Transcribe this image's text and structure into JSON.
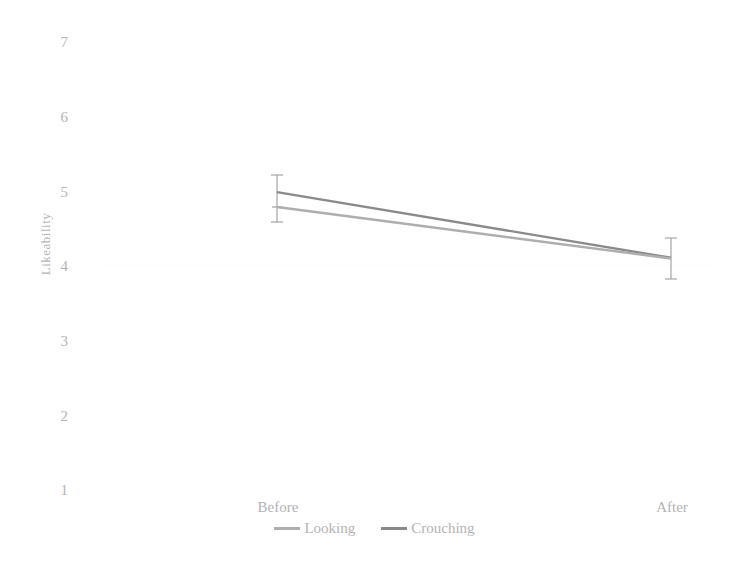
{
  "chart_data": {
    "type": "line",
    "title": "",
    "xlabel": "",
    "ylabel": "Likeability",
    "categories": [
      "Before",
      "After"
    ],
    "ylim": [
      1,
      7
    ],
    "yticks": [
      1,
      2,
      3,
      4,
      5,
      6,
      7
    ],
    "ytick_labels": [
      "1",
      "2",
      "3",
      "4",
      "5",
      "6",
      "7"
    ],
    "grid": false,
    "legend_position": "bottom-center",
    "series": [
      {
        "name": "Looking",
        "color": "#aeaeae",
        "values": [
          4.79,
          4.1
        ],
        "error_low": [
          4.62,
          3.86
        ],
        "error_high": [
          4.97,
          4.37
        ]
      },
      {
        "name": "Crouching",
        "color": "#8a8a8a",
        "values": [
          4.99,
          4.11
        ],
        "error_low": [
          4.79,
          3.86
        ],
        "error_high": [
          5.4,
          4.37
        ]
      }
    ]
  },
  "axis": {
    "y_title": "Likeability",
    "y_labels": [
      "7",
      "6",
      "5",
      "4",
      "3",
      "2",
      "1"
    ],
    "x_labels": [
      "Before",
      "After"
    ]
  },
  "legend": {
    "items": [
      {
        "label": "Looking",
        "color": "#aeaeae"
      },
      {
        "label": "Crouching",
        "color": "#8a8a8a"
      }
    ]
  },
  "colors": {
    "background": "#ffffff",
    "text": "#b3b3b3",
    "series_looking": "#aeaeae",
    "series_crouching": "#8a8a8a",
    "errorbar": "#9a9a9a",
    "gridline": "#fbfbfb"
  }
}
